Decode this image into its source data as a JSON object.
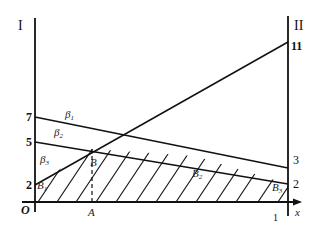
{
  "diagram": {
    "axis_left_label": "I",
    "axis_right_label": "II",
    "x_axis_label": "x",
    "origin_label": "O",
    "point_A_label": "A",
    "point_B_label": "B",
    "x_right_tick": "1",
    "left_ticks": [
      "7",
      "5",
      "2"
    ],
    "right_ticks": [
      "11",
      "3",
      "2"
    ],
    "lines": [
      {
        "name": "beta1",
        "label": "β",
        "sub": "1",
        "from_left": 7,
        "to_right": 3
      },
      {
        "name": "beta2",
        "label": "β",
        "sub": "2",
        "from_left": 5,
        "to_right": 2
      },
      {
        "name": "beta3",
        "label": "β",
        "sub": "3",
        "from_left": 2,
        "to_right": 11
      }
    ],
    "points": [
      {
        "label": "B",
        "sub": "1"
      },
      {
        "label": "B",
        "sub": "2"
      },
      {
        "label": "B",
        "sub": "3"
      }
    ],
    "colors": {
      "stroke": "#111111",
      "background": "#ffffff"
    }
  }
}
